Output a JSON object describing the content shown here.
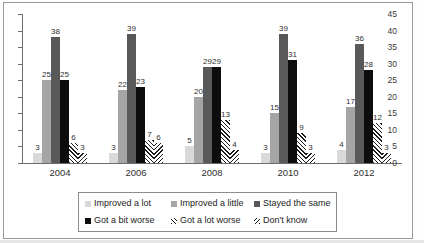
{
  "chart_data": {
    "type": "bar",
    "title": "",
    "xlabel": "",
    "ylabel": "",
    "ylim": [
      0,
      45
    ],
    "yticks": [
      0,
      5,
      10,
      15,
      20,
      25,
      30,
      35,
      40,
      45
    ],
    "grid": false,
    "legend_position": "bottom",
    "categories": [
      "2004",
      "2006",
      "2008",
      "2010",
      "2012"
    ],
    "series": [
      {
        "name": "Improved a lot",
        "color": "#d9d9d9",
        "pattern": "solid",
        "values": [
          3,
          3,
          5,
          3,
          4
        ]
      },
      {
        "name": "Improved a little",
        "color": "#a5a5a5",
        "pattern": "solid",
        "values": [
          25,
          22,
          20,
          15,
          17
        ]
      },
      {
        "name": "Stayed the same",
        "color": "#595959",
        "pattern": "solid",
        "values": [
          38,
          39,
          29,
          39,
          36
        ]
      },
      {
        "name": "Got a bit worse",
        "color": "#0d0d0d",
        "pattern": "solid",
        "values": [
          25,
          23,
          29,
          31,
          28
        ]
      },
      {
        "name": "Got a lot worse",
        "color": "#1b1b1b",
        "pattern": "hatch-fwd",
        "values": [
          6,
          7,
          13,
          9,
          12
        ]
      },
      {
        "name": "Don't know",
        "color": "#1b1b1b",
        "pattern": "hatch-back",
        "values": [
          3,
          6,
          4,
          3,
          3
        ]
      }
    ]
  },
  "legend": {
    "items": [
      "Improved a lot",
      "Improved a little",
      "Stayed the same",
      "Got a bit worse",
      "Got a lot worse",
      "Don't know"
    ]
  }
}
